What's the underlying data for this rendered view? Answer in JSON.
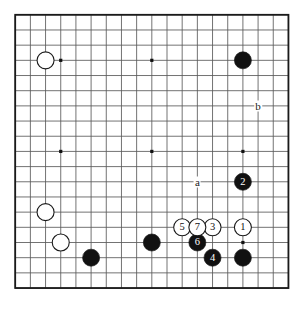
{
  "board": {
    "title": "go-board-diagram",
    "size": 19,
    "grid": {
      "origin_x": 15.2,
      "origin_y": 14.8,
      "spacing": 15.18,
      "line_color": "#5a5a5a",
      "border_color": "#1a1a1a",
      "background": "#ffffff"
    },
    "star_points": [
      {
        "col": 3,
        "row": 3
      },
      {
        "col": 9,
        "row": 3
      },
      {
        "col": 15,
        "row": 3
      },
      {
        "col": 3,
        "row": 9
      },
      {
        "col": 9,
        "row": 9
      },
      {
        "col": 15,
        "row": 9
      },
      {
        "col": 3,
        "row": 15
      },
      {
        "col": 9,
        "row": 15
      },
      {
        "col": 15,
        "row": 15
      }
    ],
    "colors": {
      "black_stone": "#111111",
      "white_stone": "#ffffff",
      "stone_outline": "#1a1a1a",
      "black_number_text": "#ffffff",
      "white_number_text": "#111111"
    }
  },
  "stones": [
    {
      "id": "white-upper-left",
      "col": 2,
      "row": 3,
      "color": "white",
      "label": ""
    },
    {
      "id": "black-upper-right",
      "col": 15,
      "row": 3,
      "color": "black",
      "label": ""
    },
    {
      "id": "white-left-lower-1",
      "col": 2,
      "row": 13,
      "color": "white",
      "label": ""
    },
    {
      "id": "white-left-lower-2",
      "col": 3,
      "row": 15,
      "color": "white",
      "label": ""
    },
    {
      "id": "black-bottom-left",
      "col": 5,
      "row": 16,
      "color": "black",
      "label": ""
    },
    {
      "id": "black-bottom-center",
      "col": 9,
      "row": 15,
      "color": "black",
      "label": ""
    },
    {
      "id": "black-bottom-right",
      "col": 15,
      "row": 16,
      "color": "black",
      "label": ""
    },
    {
      "id": "move-1-white",
      "col": 15,
      "row": 14,
      "color": "white",
      "label": "1"
    },
    {
      "id": "move-2-black",
      "col": 15,
      "row": 11,
      "color": "black",
      "label": "2"
    },
    {
      "id": "move-3-white",
      "col": 13,
      "row": 14,
      "color": "white",
      "label": "3"
    },
    {
      "id": "move-4-black",
      "col": 13,
      "row": 16,
      "color": "black",
      "label": "4"
    },
    {
      "id": "move-5-white",
      "col": 11,
      "row": 14,
      "color": "white",
      "label": "5"
    },
    {
      "id": "move-6-black",
      "col": 12,
      "row": 15,
      "color": "black",
      "label": "6"
    },
    {
      "id": "move-7-white",
      "col": 12,
      "row": 14,
      "color": "white",
      "label": "7"
    }
  ],
  "point_labels": [
    {
      "id": "point-label-a",
      "text": "a",
      "col": 12,
      "row": 11
    },
    {
      "id": "point-label-b",
      "text": "b",
      "col": 16,
      "row": 6
    }
  ]
}
